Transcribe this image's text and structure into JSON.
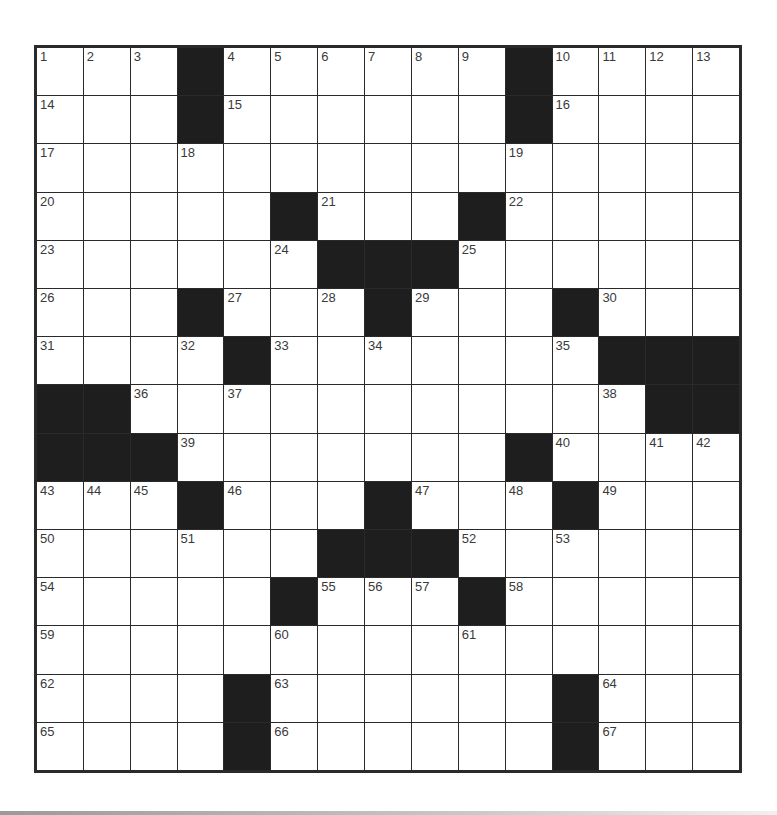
{
  "puzzle": {
    "rows": 15,
    "cols": 15,
    "layout": [
      "1,2,3,#,4,5,6,7,8,9,#,10,11,12,13",
      "14,.,.,#,15,.,.,.,.,.,#,16,.,.,.",
      "17,.,.,18,.,.,.,.,.,.,19,.,.,.,.",
      "20,.,.,.,.,#,21,.,.,#,22,.,.,.,.",
      "23,.,.,.,.,24,#,#,#,25,.,.,.,.,.",
      "26,.,.,#,27,.,28,#,29,.,.,#,30,.,.",
      "31,.,.,32,#,33,.,34,.,.,.,35,#,#,#",
      "#,#,36,.,37,.,.,.,.,.,.,.,38,#,#",
      "#,#,#,39,.,.,.,.,.,.,#,40,.,41,42",
      "43,44,45,#,46,.,.,#,47,.,48,#,49,.,.",
      "50,.,.,51,.,.,#,#,#,52,.,53,.,.,.",
      "54,.,.,.,.,#,55,56,57,#,58,.,.,.,.",
      "59,.,.,.,.,60,.,.,.,61,.,.,.,.,.",
      "62,.,.,.,#,63,.,.,.,.,.,#,64,.,.",
      "65,.,.,.,#,66,.,.,.,.,.,#,67,.,."
    ],
    "colors": {
      "black_square": "#1e1e1e",
      "white_square": "#ffffff",
      "border": "#2a2a2a",
      "number": "#3a3a3a"
    }
  }
}
